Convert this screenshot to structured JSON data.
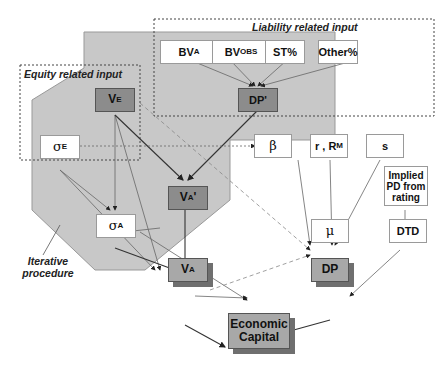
{
  "diagram": {
    "groups": {
      "liability": "Liability related input",
      "equity": "Equity related input",
      "iterative": "Iterative procedure"
    },
    "nodes": {
      "bva": {
        "main": "BV",
        "sub": "A"
      },
      "bvobs": {
        "main": "BV",
        "sub": "OBS"
      },
      "st": {
        "main": "ST%"
      },
      "other": {
        "main": "Other%"
      },
      "dpprime": {
        "main": "DP'"
      },
      "ve": {
        "main": "V",
        "sub": "E"
      },
      "sigmae": {
        "main": "σ",
        "sub": "E"
      },
      "vaprime": {
        "main": "V",
        "sub": "A",
        "suffix": "'"
      },
      "sigmaa": {
        "main": "σ",
        "sub": "A"
      },
      "va": {
        "main": "V",
        "sub": "A"
      },
      "beta": {
        "main": "β"
      },
      "rrm": {
        "main": "r , R",
        "sub": "M"
      },
      "s": {
        "main": "s"
      },
      "implied": {
        "main": "Implied PD from rating"
      },
      "mu": {
        "main": "μ"
      },
      "dtd": {
        "main": "DTD"
      },
      "dp": {
        "main": "DP"
      },
      "ec": {
        "main": "Economic Capital"
      }
    },
    "edges": [
      {
        "from": "BV_A",
        "to": "DP'"
      },
      {
        "from": "BV_OBS",
        "to": "DP'"
      },
      {
        "from": "ST%",
        "to": "DP'"
      },
      {
        "from": "Other%",
        "to": "DP'"
      },
      {
        "from": "V_E",
        "to": "V_A'"
      },
      {
        "from": "DP'",
        "to": "V_A'"
      },
      {
        "from": "V_E",
        "to": "σ_A"
      },
      {
        "from": "V_E",
        "to": "V_A"
      },
      {
        "from": "V_E",
        "to": "μ",
        "style": "dashed"
      },
      {
        "from": "σ_E",
        "to": "β",
        "style": "dotted"
      },
      {
        "from": "σ_E",
        "to": "σ_A"
      },
      {
        "from": "σ_E",
        "to": "V_A"
      },
      {
        "from": "V_A'",
        "to": "σ_A"
      },
      {
        "from": "V_A'",
        "to": "V_A"
      },
      {
        "from": "σ_A",
        "to": "V_A"
      },
      {
        "from": "σ_A",
        "to": "DP"
      },
      {
        "from": "β",
        "to": "μ"
      },
      {
        "from": "r,R_M",
        "to": "μ"
      },
      {
        "from": "s",
        "to": "μ"
      },
      {
        "from": "Implied PD",
        "to": "DTD"
      },
      {
        "from": "μ",
        "to": "DP"
      },
      {
        "from": "DTD",
        "to": "DP"
      },
      {
        "from": "V_A",
        "to": "DP"
      },
      {
        "from": "V_A",
        "to": "μ",
        "style": "dashed"
      },
      {
        "from": "V_A",
        "to": "Economic Capital"
      },
      {
        "from": "DP",
        "to": "Economic Capital"
      }
    ]
  }
}
